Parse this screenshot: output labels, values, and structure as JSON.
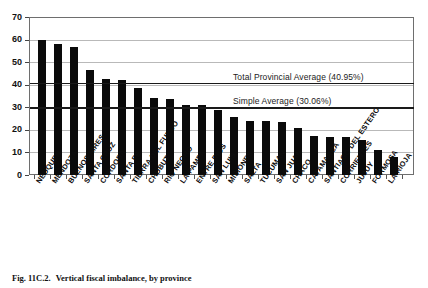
{
  "figure": {
    "caption_number": "Fig. 11C.2.",
    "caption_text": "Vertical fiscal imbalance, by province"
  },
  "chart_data": {
    "type": "bar",
    "title": "",
    "subtitle": "",
    "xlabel": "",
    "ylabel": "",
    "ylim": [
      0,
      70
    ],
    "ytick_step": 10,
    "grid": true,
    "legend": "none",
    "orientation": "vertical",
    "bar_color": "#0a0a0a",
    "yticks": [
      "0",
      "10",
      "20",
      "30",
      "40",
      "50",
      "60",
      "70"
    ],
    "categories": [
      "NEUQUEN",
      "MENDOZA",
      "BUENOS AIRES",
      "SANTA CRUZ",
      "CORDOBA",
      "SANTA FE",
      "TIERRA DEL FUEGO",
      "CHUBUT",
      "RIO NEGRO",
      "LA PAMPA",
      "ENTRE RIOS",
      "SAN LUIS",
      "MISIONES",
      "SALTA",
      "TUCUMAN",
      "SAN JUAN",
      "CHACO",
      "CATAMARCA",
      "SANTIAGO DEL ESTERO",
      "CORRIENTES",
      "JUJUY",
      "FORMOSA",
      "LA RIOJA"
    ],
    "values": [
      60.0,
      58.5,
      57.0,
      47.0,
      43.0,
      42.5,
      39.0,
      34.5,
      34.0,
      31.0,
      31.0,
      29.0,
      26.0,
      24.0,
      24.0,
      23.5,
      21.0,
      17.5,
      17.0,
      17.0,
      15.5,
      11.0,
      8.0
    ],
    "annotations": [
      {
        "name": "total-provincial-average",
        "label": "Total Provincial Average (40.95%)",
        "value": 40.95
      },
      {
        "name": "simple-average",
        "label": "Simple Average (30.06%)",
        "value": 30.06
      }
    ]
  }
}
